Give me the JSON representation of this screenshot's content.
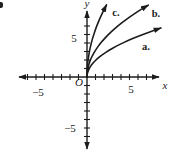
{
  "figure": {
    "width_px": 170,
    "height_px": 155,
    "background": "#ffffff",
    "ink": "#1c1c1c",
    "corner_artifact": true
  },
  "chart_data": {
    "type": "line",
    "axes": {
      "x_label": "x",
      "y_label": "y",
      "origin_label": "O",
      "x_range_shown": [
        -7.5,
        8.5
      ],
      "y_range_shown": [
        -8.5,
        8
      ],
      "tick_step": 1,
      "x_ticks": [
        -7,
        -6,
        -5,
        -4,
        -3,
        -2,
        -1,
        1,
        2,
        3,
        4,
        5,
        6,
        7
      ],
      "y_ticks": [
        -7,
        -6,
        -5,
        -4,
        -3,
        -2,
        -1,
        1,
        2,
        3,
        4,
        5,
        6
      ],
      "grid": false,
      "number_labels": [
        {
          "name": "x-axis-number-neg5",
          "axis": "x",
          "value": -5,
          "text": "−5",
          "px": [
            38,
            96
          ]
        },
        {
          "name": "x-axis-number-5",
          "axis": "x",
          "value": 5,
          "text": "5",
          "px": [
            131,
            93
          ]
        },
        {
          "name": "y-axis-number-5",
          "axis": "y",
          "value": 5,
          "text": "5",
          "px": [
            74,
            42
          ]
        },
        {
          "name": "y-axis-number-neg5",
          "axis": "y",
          "value": -5,
          "text": "−5",
          "px": [
            70,
            132
          ]
        }
      ]
    },
    "series": [
      {
        "name": "a",
        "label": "a.",
        "shape": "square-root",
        "approx_equation": "y ≈ 1.95·√x",
        "k": 1.95,
        "x_end": 8.7,
        "end_point_units": [
          8.7,
          5.7
        ],
        "label_px": [
          146,
          50
        ]
      },
      {
        "name": "b",
        "label": "b.",
        "shape": "square-root",
        "approx_equation": "y ≈ 3.15·√x",
        "k": 3.15,
        "x_end": 7.2,
        "end_point_units": [
          7.2,
          8.5
        ],
        "label_px": [
          156,
          17
        ]
      },
      {
        "name": "c",
        "label": "c.",
        "shape": "square-root",
        "approx_equation": "y ≈ 5.6·√x",
        "k": 5.6,
        "x_end": 2.3,
        "end_point_units": [
          2.3,
          8.5
        ],
        "label_px": [
          116,
          16
        ]
      }
    ],
    "letter_labels": [
      {
        "name": "y-axis-letter",
        "text": "y",
        "px": [
          87,
          7
        ],
        "italic": true
      },
      {
        "name": "x-axis-letter",
        "text": "x",
        "px": [
          165,
          89
        ],
        "italic": true
      },
      {
        "name": "origin-letter",
        "text": "O",
        "px": [
          79,
          86
        ],
        "italic": true
      }
    ],
    "layout": {
      "origin_px": [
        87,
        77
      ],
      "px_per_unit": 8.5,
      "x_axis_px_span": [
        17,
        161
      ],
      "y_axis_px_span": [
        9,
        151
      ],
      "tick_half_len_px": 3,
      "legend": "none"
    }
  }
}
